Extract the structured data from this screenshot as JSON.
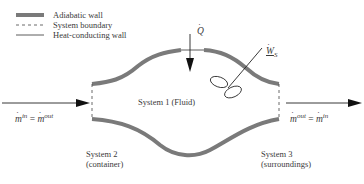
{
  "legend": {
    "items": [
      {
        "style": "adiabatic",
        "label": "Adiabatic wall"
      },
      {
        "style": "dashed",
        "label": "System boundary"
      },
      {
        "style": "thin",
        "label": "Heat-conducting wall"
      }
    ]
  },
  "labels": {
    "heat": {
      "symbol": "Q",
      "dot": true
    },
    "work": {
      "symbol": "W",
      "subscript": "S",
      "dot": true,
      "underline": true
    },
    "system1": "System 1 (Fluid)",
    "system2": {
      "line1": "System 2",
      "line2": "(container)"
    },
    "system3": {
      "line1": "System 3",
      "line2": "(surroundings)"
    },
    "inlet": {
      "lhs_base": "m",
      "lhs_sup": "in",
      "eq": "=",
      "rhs_base": "m",
      "rhs_sup": "out"
    },
    "outlet": {
      "lhs_base": "m",
      "lhs_sup": "out",
      "eq": "=",
      "rhs_base": "m",
      "rhs_sup": "in"
    }
  },
  "colors": {
    "adiabatic": "#7a7a7a",
    "line": "#222222",
    "text": "#3a3a3a"
  }
}
